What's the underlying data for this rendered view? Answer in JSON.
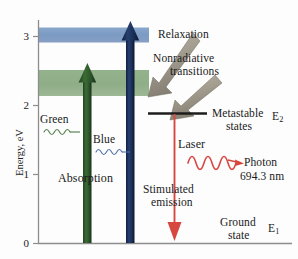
{
  "figure": {
    "axis": {
      "ylabel": "Energy, eV",
      "ticks": [
        "0",
        "1",
        "2",
        "3"
      ],
      "tick_values": [
        0,
        1,
        2,
        3
      ],
      "ymin": 0,
      "ymax": 3.35,
      "axis_color": "#8a8a8a"
    },
    "bands": [
      {
        "name": "upper-pump-band",
        "label": "",
        "color": "#7e9cc4",
        "e_low": 2.93,
        "e_high": 3.13
      },
      {
        "name": "lower-pump-band",
        "label": "",
        "color": "#8fb089",
        "e_low": 2.15,
        "e_high": 2.52
      }
    ],
    "levels": [
      {
        "name": "metastable-level",
        "label": "Metastable",
        "label2": "states",
        "symbol": "E",
        "subscript": "2",
        "energy": 1.88
      },
      {
        "name": "ground-level",
        "label": "Ground",
        "label2": "state",
        "symbol": "E",
        "subscript": "1",
        "energy": 0.0
      }
    ],
    "arrows": {
      "green_pump": {
        "label": "Green",
        "color": "#2c5a2c",
        "energy_top": 2.53
      },
      "blue_pump": {
        "label": "Blue",
        "color": "#1b2c52",
        "energy_top": 3.14
      },
      "absorption_label": "Absorption",
      "relaxation_label": "Relaxation",
      "nonradiative_label": "Nonradiative",
      "nonradiative_label2": "transitions",
      "relaxation_color": "#9a958a",
      "laser_label": "Laser",
      "laser_color": "#d6483f",
      "stimulated_label": "Stimulated",
      "stimulated_label2": "emission"
    },
    "photon": {
      "label": "Photon",
      "wavelength": "694.3 nm",
      "color": "#d6483f"
    }
  }
}
